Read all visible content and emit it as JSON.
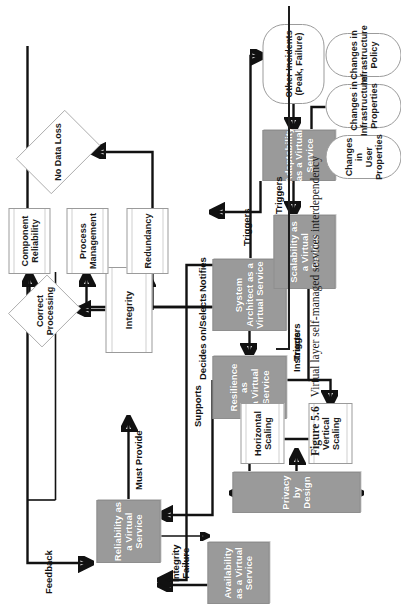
{
  "figure": {
    "number": "Figure 5.6",
    "caption": "Virtual layer self-managed services interdependency"
  },
  "nodes": {
    "reliability": "Reliability as\na Virtual\nService",
    "availability": "Availability\nas a Virtual\nService",
    "resilience": "Resilience as\na Virtual\nService",
    "system_architect": "System\nArchitect as a\nVirtual Service",
    "scalability": "Scalability as\na Virtual\nService",
    "adaptability": "Adaptability\nas a Virtual\nService",
    "privacy": "Privacy by Design",
    "integrity": "Integrity",
    "component_reliability": "Component\nReliability",
    "process_management": "Process\nManagement",
    "redundancy": "Redundancy",
    "horizontal_scaling": "Horizontal\nScaling",
    "vertical_scaling": "Vertical\nScaling",
    "correct_processing": "Correct\nProcessing",
    "no_data_loss": "No Data Loss",
    "other_incidents": "Other Incidents\n(Peak, Failure)",
    "changes_user_properties": "Changes in\nUser\nProperties",
    "changes_infrastructure_properties": "Changes in\nInfrastructure\nProperties",
    "changes_infrastructure_policy": "Changes in\nInfrastructure\nPolicy"
  },
  "edges": {
    "feedback": "Feedback",
    "must_provide": "Must Provide",
    "integrity_failure": "Integrity\nFailure",
    "supports": "Supports",
    "decides_on_selects": "Decides on/Selects",
    "triggers_resilience": "Triggers",
    "triggers_architect": "Triggers",
    "triggers_scalability": "Triggers",
    "notifies": "Notifies",
    "instructs": "Instructs"
  },
  "colors": {
    "service_fill": "#9a9a9a",
    "service_text": "#ffffff",
    "plain_fill": "#ffffff",
    "stroke": "#111111"
  }
}
